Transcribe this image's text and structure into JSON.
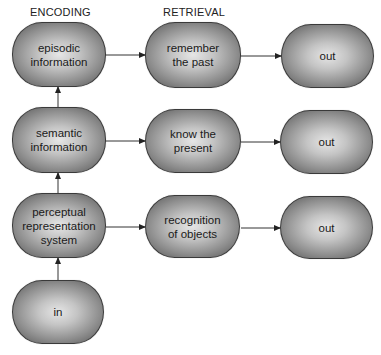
{
  "headers": {
    "encoding": "ENCODING",
    "retrieval": "RETRIEVAL"
  },
  "nodes": {
    "episodic": "episodic\ninformation",
    "semantic": "semantic\ninformation",
    "perceptual": "perceptual\nrepresentation\nsystem",
    "input": "in",
    "remember": "remember\nthe past",
    "know": "know the\npresent",
    "recognition": "recognition\nof objects",
    "out1": "out",
    "out2": "out",
    "out3": "out"
  },
  "edges": [
    {
      "from": "input",
      "to": "perceptual"
    },
    {
      "from": "perceptual",
      "to": "semantic"
    },
    {
      "from": "semantic",
      "to": "episodic"
    },
    {
      "from": "episodic",
      "to": "remember"
    },
    {
      "from": "semantic",
      "to": "know"
    },
    {
      "from": "perceptual",
      "to": "recognition"
    },
    {
      "from": "remember",
      "to": "out1"
    },
    {
      "from": "know",
      "to": "out2"
    },
    {
      "from": "recognition",
      "to": "out3"
    }
  ],
  "colors": {
    "node_center": "#e6e6e6",
    "node_edge": "#6a6a6a",
    "outline": "#3a3a3a",
    "arrow": "#222222"
  }
}
